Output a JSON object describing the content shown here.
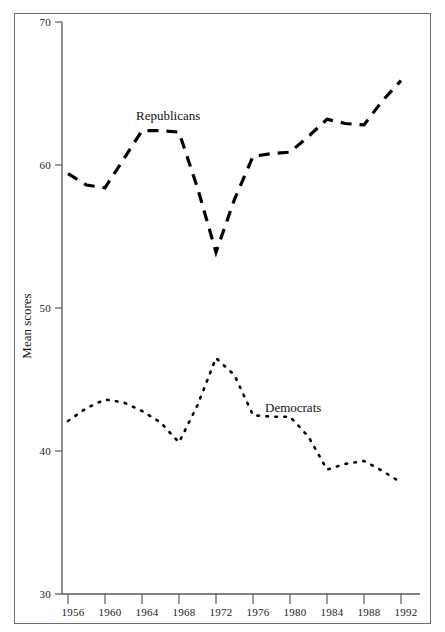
{
  "chart_data": {
    "type": "line",
    "title": "",
    "subtitle": "",
    "xlabel": "",
    "ylabel": "Mean scores",
    "xlim": [
      1954,
      1994
    ],
    "ylim": [
      30,
      70
    ],
    "grid": false,
    "legend_position": "inline-annotations",
    "x_ticks": [
      "1956",
      "1960",
      "1964",
      "1968",
      "1972",
      "1976",
      "1980",
      "1984",
      "1988",
      "1992"
    ],
    "x_tick_values": [
      1956,
      1960,
      1964,
      1968,
      1972,
      1976,
      1980,
      1984,
      1988,
      1992
    ],
    "y_ticks": [
      "30",
      "40",
      "50",
      "60",
      "70"
    ],
    "y_tick_values": [
      30,
      40,
      50,
      60,
      70
    ],
    "x": [
      1956,
      1958,
      1960,
      1962,
      1964,
      1966,
      1968,
      1970,
      1972,
      1974,
      1976,
      1978,
      1980,
      1982,
      1984,
      1986,
      1988,
      1990,
      1992
    ],
    "series": [
      {
        "name": "Republicans",
        "style": "dashed",
        "color": "#000000",
        "values": [
          59.4,
          58.6,
          58.4,
          60.4,
          62.4,
          62.4,
          62.3,
          58.4,
          53.9,
          57.6,
          60.6,
          60.8,
          60.9,
          62.0,
          63.2,
          62.9,
          62.8,
          64.5,
          65.9
        ]
      },
      {
        "name": "Democrats",
        "style": "dotted",
        "color": "#000000",
        "values": [
          42.1,
          43.0,
          43.6,
          43.4,
          42.8,
          42.0,
          40.6,
          43.2,
          46.5,
          45.3,
          42.5,
          42.4,
          42.4,
          41.0,
          38.7,
          39.1,
          39.3,
          38.6,
          37.8
        ]
      }
    ],
    "annotations": [
      {
        "text": "Republicans",
        "x": 1965,
        "y": 64.5
      },
      {
        "text": "Democrats",
        "x": 1979,
        "y": 44.2
      }
    ]
  },
  "axes": {
    "y_label": "Mean scores",
    "y_ticks": [
      "70",
      "60",
      "50",
      "40",
      "30"
    ],
    "x_ticks": [
      "1956",
      "1960",
      "1964",
      "1968",
      "1972",
      "1976",
      "1980",
      "1984",
      "1988",
      "1992"
    ]
  },
  "labels": {
    "republicans": "Republicans",
    "democrats": "Democrats"
  },
  "colors": {
    "line": "#000000",
    "axis": "#5a5a5a",
    "frame": "#6f6f6f",
    "text": "#111111",
    "background": "#ffffff"
  }
}
